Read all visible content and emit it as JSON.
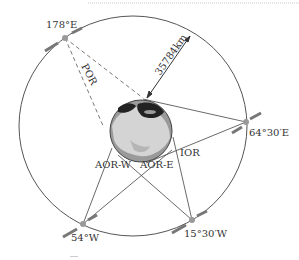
{
  "diagram": {
    "distance_label": "35784km",
    "satellites": [
      {
        "id": "por",
        "label": "178°E"
      },
      {
        "id": "ior",
        "label": "64°30′E"
      },
      {
        "id": "aorw",
        "label": "54°W"
      },
      {
        "id": "aore",
        "label": "15°30′W"
      }
    ],
    "regions": [
      {
        "id": "por",
        "label": "POR"
      },
      {
        "id": "ior",
        "label": "IOR"
      },
      {
        "id": "aorw",
        "label": "AOR-W"
      },
      {
        "id": "aore",
        "label": "AOR-E"
      }
    ],
    "colors": {
      "orbit": "#555555",
      "line": "#444444",
      "globe_ocean": "#9a9a9a",
      "globe_land": "#d9d9d9",
      "globe_dark": "#222222",
      "satellite": "#888888"
    }
  }
}
